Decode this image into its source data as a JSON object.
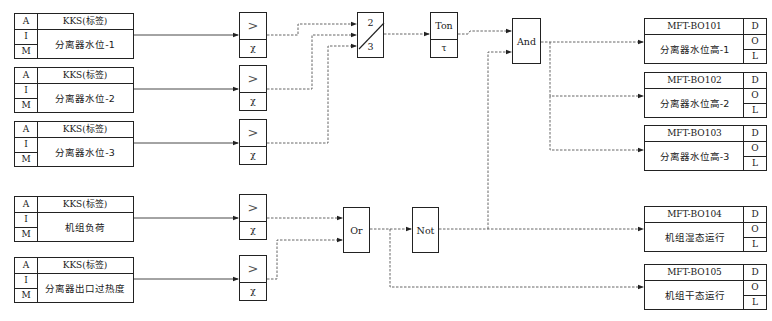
{
  "inputs": [
    {
      "col": [
        "A",
        "I",
        "M"
      ],
      "tag": "KKS(标签)",
      "name": "分离器水位-1"
    },
    {
      "col": [
        "A",
        "I",
        "M"
      ],
      "tag": "KKS(标签)",
      "name": "分离器水位-2"
    },
    {
      "col": [
        "A",
        "I",
        "M"
      ],
      "tag": "KKS(标签)",
      "name": "分离器水位-3"
    },
    {
      "col": [
        "A",
        "I",
        "M"
      ],
      "tag": "KKS(标签)",
      "name": "机组负荷"
    },
    {
      "col": [
        "A",
        "I",
        "M"
      ],
      "tag": "KKS(标签)",
      "name": "分离器出口过热度"
    }
  ],
  "comparators": [
    {
      "op": ">",
      "param": "χ"
    },
    {
      "op": ">",
      "param": "χ"
    },
    {
      "op": ">",
      "param": "χ"
    },
    {
      "op": ">",
      "param": "χ"
    },
    {
      "op": ">",
      "param": "χ"
    }
  ],
  "vote": {
    "top": "2",
    "bottom": "3"
  },
  "ton": {
    "label": "Ton",
    "param": "τ"
  },
  "and_gate": {
    "label": "And"
  },
  "or_gate": {
    "label": "Or"
  },
  "not_gate": {
    "label": "Not"
  },
  "outputs": [
    {
      "tag": "MFT-BO101",
      "name": "分离器水位高-1",
      "col": [
        "D",
        "O",
        "L"
      ]
    },
    {
      "tag": "MFT-BO102",
      "name": "分离器水位高-2",
      "col": [
        "D",
        "O",
        "L"
      ]
    },
    {
      "tag": "MFT-BO103",
      "name": "分离器水位高-3",
      "col": [
        "D",
        "O",
        "L"
      ]
    },
    {
      "tag": "MFT-BO104",
      "name": "机组湿态运行",
      "col": [
        "D",
        "O",
        "L"
      ]
    },
    {
      "tag": "MFT-BO105",
      "name": "机组干态运行",
      "col": [
        "D",
        "O",
        "L"
      ]
    }
  ]
}
